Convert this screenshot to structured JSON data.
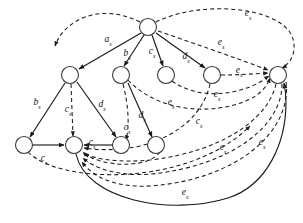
{
  "figure": {
    "type": "directed-graph",
    "title": "",
    "background_color": "#ffffff",
    "node_fill": "#ffffff",
    "node_stroke": "#3a3a3a",
    "edge_color": "#1a1a1a",
    "node_radius": 8.5
  },
  "nodes": [
    {
      "id": "n0",
      "label": "",
      "x": 148,
      "y": 27,
      "name": "node-root"
    },
    {
      "id": "n1",
      "label": "",
      "x": 70,
      "y": 75,
      "name": "node-left-upper"
    },
    {
      "id": "n2",
      "label": "",
      "x": 121,
      "y": 75,
      "name": "node-mid-upper"
    },
    {
      "id": "n3",
      "label": "",
      "x": 166,
      "y": 75,
      "name": "node-mid-right-upper"
    },
    {
      "id": "n4",
      "label": "",
      "x": 212,
      "y": 75,
      "name": "node-right-upper"
    },
    {
      "id": "n5",
      "label": "",
      "x": 278,
      "y": 75,
      "name": "node-far-right"
    },
    {
      "id": "n6",
      "label": "",
      "x": 24,
      "y": 145,
      "name": "node-bottom-left"
    },
    {
      "id": "n7",
      "label": "",
      "x": 74,
      "y": 145,
      "name": "node-bottom-center"
    },
    {
      "id": "n8",
      "label": "",
      "x": 121,
      "y": 145,
      "name": "node-bottom-mid"
    },
    {
      "id": "n9",
      "label": "",
      "x": 156,
      "y": 145,
      "name": "node-bottom-right"
    }
  ],
  "labels": [
    {
      "id": "L1",
      "base": "a",
      "sub": "s",
      "x": 108,
      "y": 40,
      "name": "edge-label-as-root-to-left"
    },
    {
      "id": "L2",
      "base": "b",
      "sub": "s",
      "x": 127,
      "y": 54,
      "name": "edge-label-bs-root-to-mid"
    },
    {
      "id": "L3",
      "base": "c",
      "sub": "s",
      "x": 152,
      "y": 52,
      "name": "edge-label-cs-root-to-midright"
    },
    {
      "id": "L4",
      "base": "d",
      "sub": "s",
      "x": 186,
      "y": 57,
      "name": "edge-label-ds-root-to-right"
    },
    {
      "id": "L5",
      "base": "e",
      "sub": "s",
      "x": 248,
      "y": 14,
      "name": "edge-label-es-top-outer"
    },
    {
      "id": "L6",
      "base": "e",
      "sub": "s",
      "x": 221,
      "y": 43,
      "name": "edge-label-es-root-to-farright"
    },
    {
      "id": "L7",
      "base": "e",
      "sub": "s",
      "x": 239,
      "y": 71,
      "name": "edge-label-es-right-to-farright"
    },
    {
      "id": "L8",
      "base": "b",
      "sub": "s",
      "x": 37,
      "y": 103,
      "name": "edge-label-bs-left-to-bottomleft"
    },
    {
      "id": "L9",
      "base": "c",
      "sub": "s",
      "x": 68,
      "y": 110,
      "name": "edge-label-cs-left-to-bottomcenter"
    },
    {
      "id": "L10",
      "base": "d",
      "sub": "s",
      "x": 102,
      "y": 105,
      "name": "edge-label-ds-left-to-bottommid"
    },
    {
      "id": "L11",
      "base": "c",
      "sub": "s",
      "x": 127,
      "y": 128,
      "name": "edge-label-cs-mid-to-bottommid"
    },
    {
      "id": "L12",
      "base": "d",
      "sub": "s",
      "x": 142,
      "y": 116,
      "name": "edge-label-ds-mid-to-bottomright"
    },
    {
      "id": "L13",
      "base": "e",
      "sub": "s",
      "x": 171,
      "y": 103,
      "name": "edge-label-es-mid-cross"
    },
    {
      "id": "L14",
      "base": "e",
      "sub": "s",
      "x": 217,
      "y": 95,
      "name": "edge-label-es-right-cross"
    },
    {
      "id": "L15",
      "base": "c",
      "sub": "s",
      "x": 199,
      "y": 122,
      "name": "edge-label-cs-right-descend"
    },
    {
      "id": "L16",
      "base": "c",
      "sub": "s",
      "x": 92,
      "y": 143,
      "name": "edge-label-cs-bottom-inner"
    },
    {
      "id": "L17",
      "base": "c",
      "sub": "s",
      "x": 44,
      "y": 159,
      "name": "edge-label-cs-bottomleft-outer"
    },
    {
      "id": "L18",
      "base": "e",
      "sub": "s",
      "x": 223,
      "y": 148,
      "name": "edge-label-es-lower-right-a"
    },
    {
      "id": "L19",
      "base": "e",
      "sub": "s",
      "x": 262,
      "y": 143,
      "name": "edge-label-es-lower-right-b"
    },
    {
      "id": "L20",
      "base": "e",
      "sub": "s",
      "x": 185,
      "y": 193,
      "name": "edge-label-es-bottom-outer"
    }
  ],
  "edges": [
    {
      "id": "E1",
      "style": "solid",
      "from": "n0",
      "to": "n1",
      "name": "edge-root-to-left-upper"
    },
    {
      "id": "E2",
      "style": "solid",
      "from": "n0",
      "to": "n2",
      "name": "edge-root-to-mid-upper"
    },
    {
      "id": "E3",
      "style": "solid",
      "from": "n0",
      "to": "n3",
      "name": "edge-root-to-mid-right-upper"
    },
    {
      "id": "E4",
      "style": "solid",
      "from": "n0",
      "to": "n4",
      "name": "edge-root-to-right-upper"
    },
    {
      "id": "E5",
      "style": "dashed",
      "from": "n0",
      "to": "n5",
      "name": "edge-root-to-far-right"
    },
    {
      "id": "E6",
      "style": "dashed",
      "from": "n0",
      "to": "n5",
      "name": "edge-root-outer-to-far-right"
    },
    {
      "id": "E7",
      "style": "dashed",
      "from": "n1",
      "to": "n0",
      "name": "edge-left-upper-to-root-outer"
    },
    {
      "id": "E8",
      "style": "solid",
      "from": "n1",
      "to": "n6",
      "name": "edge-left-upper-to-bottom-left"
    },
    {
      "id": "E9",
      "style": "dashed",
      "from": "n1",
      "to": "n7",
      "name": "edge-left-upper-to-bottom-center"
    },
    {
      "id": "E10",
      "style": "solid",
      "from": "n1",
      "to": "n8",
      "name": "edge-left-upper-to-bottom-mid"
    },
    {
      "id": "E11",
      "style": "dashed",
      "from": "n2",
      "to": "n8",
      "name": "edge-mid-upper-to-bottom-mid"
    },
    {
      "id": "E12",
      "style": "solid",
      "from": "n2",
      "to": "n9",
      "name": "edge-mid-upper-to-bottom-right"
    },
    {
      "id": "E13",
      "style": "dashed",
      "from": "n2",
      "to": "n5",
      "name": "edge-mid-upper-to-far-right"
    },
    {
      "id": "E14",
      "style": "dashed",
      "from": "n3",
      "to": "n5",
      "name": "edge-mid-right-to-far-right"
    },
    {
      "id": "E15",
      "style": "dashed",
      "from": "n4",
      "to": "n5",
      "name": "edge-right-upper-to-far-right"
    },
    {
      "id": "E16",
      "style": "solid",
      "from": "n6",
      "to": "n7",
      "name": "edge-bottom-left-to-bottom-center"
    },
    {
      "id": "E17",
      "style": "solid",
      "from": "n8",
      "to": "n7",
      "name": "edge-bottom-mid-to-bottom-center"
    },
    {
      "id": "E18",
      "style": "dashed",
      "from": "n6",
      "to": "n7",
      "name": "edge-bottom-left-arc-to-center"
    },
    {
      "id": "E19",
      "style": "dashed",
      "from": "n9",
      "to": "n7",
      "name": "edge-bottom-right-arc-to-center"
    },
    {
      "id": "E20",
      "style": "dashed",
      "from": "n5",
      "to": "n7",
      "name": "edge-far-right-to-bottom-center-a"
    },
    {
      "id": "E21",
      "style": "dashed",
      "from": "n5",
      "to": "n7",
      "name": "edge-far-right-to-bottom-center-b"
    },
    {
      "id": "E22",
      "style": "solid",
      "from": "n7",
      "to": "n5",
      "name": "edge-bottom-center-to-far-right-outer"
    },
    {
      "id": "E23",
      "style": "dashed",
      "from": "n4",
      "to": "n7",
      "name": "edge-right-upper-descend-to-center"
    }
  ]
}
